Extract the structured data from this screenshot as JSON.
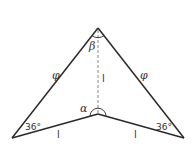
{
  "diagram": {
    "title": "",
    "colors": {
      "stroke": "#2a2a2a",
      "dashed": "#888888",
      "text": "#333333"
    },
    "vertices": {
      "apex": [
        98,
        28
      ],
      "inner": [
        98,
        114
      ],
      "left": [
        12,
        138
      ],
      "right": [
        184,
        138
      ]
    },
    "labels": {
      "left_side": "φ",
      "right_side": "φ",
      "apex_angle": "β",
      "inner_angle": "α",
      "altitude": "l",
      "left_base": "l",
      "right_base": "l",
      "left_angle": "36°",
      "right_angle": "36°"
    }
  }
}
